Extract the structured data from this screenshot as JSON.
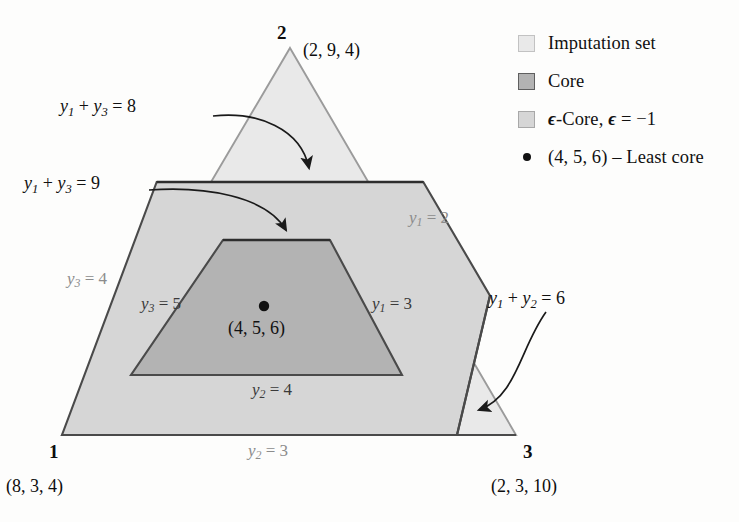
{
  "figure": {
    "type": "ternary-set-diagram"
  },
  "vertices": [
    {
      "name": "player-1",
      "number": "1",
      "coord": "(8, 3, 4)"
    },
    {
      "name": "player-2",
      "number": "2",
      "coord": "(2, 9, 4)"
    },
    {
      "name": "player-3",
      "number": "3",
      "coord": "(2, 3, 10)"
    }
  ],
  "annotations": {
    "y1y3_8": {
      "var_a": "y",
      "sub_a": "1",
      "plus": "+",
      "var_b": "y",
      "sub_b": "3",
      "eq": "= 8"
    },
    "y1y3_9": {
      "var_a": "y",
      "sub_a": "1",
      "plus": "+",
      "var_b": "y",
      "sub_b": "3",
      "eq": "= 9"
    },
    "y1y2_6": {
      "var_a": "y",
      "sub_a": "1",
      "plus": "+",
      "var_b": "y",
      "sub_b": "2",
      "eq": "= 6"
    }
  },
  "edge_labels": [
    {
      "id": "y1-eq-2",
      "var": "y",
      "sub": "1",
      "eq": "= 2",
      "shade": "light"
    },
    {
      "id": "y1-eq-3",
      "var": "y",
      "sub": "1",
      "eq": "= 3",
      "shade": "dark"
    },
    {
      "id": "y3-eq-4",
      "var": "y",
      "sub": "3",
      "eq": "= 4",
      "shade": "light"
    },
    {
      "id": "y3-eq-5",
      "var": "y",
      "sub": "3",
      "eq": "= 5",
      "shade": "dark"
    },
    {
      "id": "y2-eq-3",
      "var": "y",
      "sub": "2",
      "eq": "= 3",
      "shade": "light"
    },
    {
      "id": "y2-eq-4",
      "var": "y",
      "sub": "2",
      "eq": "= 4",
      "shade": "dark"
    }
  ],
  "least_core_point": {
    "label": "(4, 5, 6)"
  },
  "legend": {
    "items": [
      {
        "key": "imputation-set",
        "swatch": "light-gray-square",
        "text": "Imputation set"
      },
      {
        "key": "core",
        "swatch": "mid-gray-square",
        "text": "Core"
      },
      {
        "key": "epsilon-core",
        "swatch": "gray-square",
        "epsilon": "ϵ",
        "text_a": "-Core, ",
        "epsilon2": "ϵ",
        "text_b": " = −1"
      },
      {
        "key": "least-core",
        "swatch": "black-dot",
        "text": "(4, 5, 6) – Least core"
      }
    ]
  },
  "colors": {
    "imputation_fill": "#e9e9e9",
    "epsilon_core_fill": "#d6d6d6",
    "core_fill": "#b3b3b3",
    "outline_light": "#9b9b9b",
    "outline_dark": "#4a4a4a",
    "background": "#fdfdfc",
    "text": "#111111",
    "edge_label_light": "#8c8c8c"
  }
}
